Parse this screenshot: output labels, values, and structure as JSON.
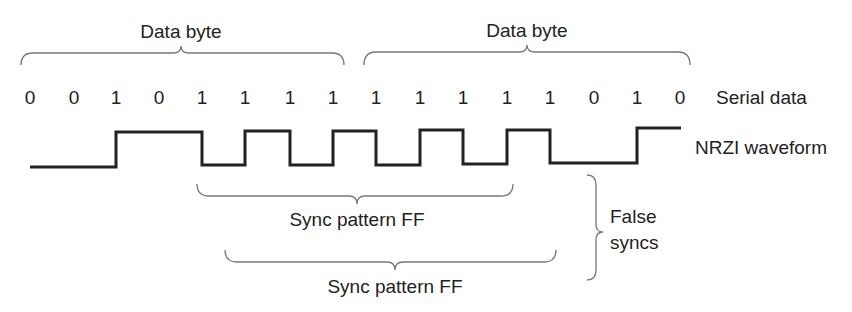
{
  "diagram": {
    "labels": {
      "data_byte_1": "Data byte",
      "data_byte_2": "Data byte",
      "serial_data": "Serial data",
      "nrzi_waveform": "NRZI waveform",
      "sync_pattern_1": "Sync pattern FF",
      "sync_pattern_2": "Sync pattern FF",
      "false_syncs_line1": "False",
      "false_syncs_line2": "syncs"
    },
    "bits": [
      "0",
      "0",
      "1",
      "0",
      "1",
      "1",
      "1",
      "1",
      "1",
      "1",
      "1",
      "1",
      "1",
      "0",
      "1",
      "0"
    ],
    "colors": {
      "text": "#222222",
      "waveform": "#222222",
      "brace": "#777777",
      "background": "#ffffff"
    }
  }
}
